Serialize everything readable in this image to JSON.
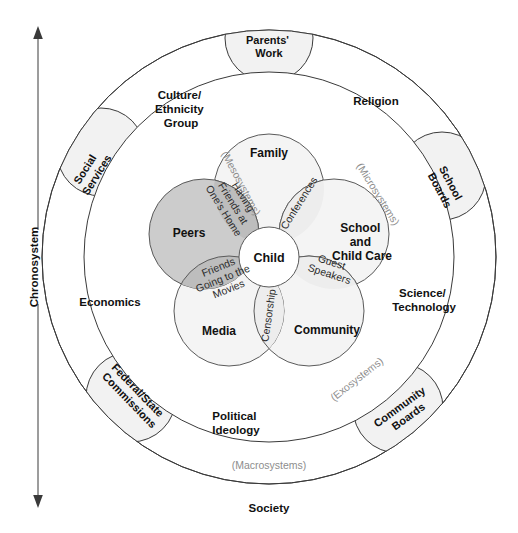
{
  "diagram": {
    "axis": {
      "label": "Chronosystem",
      "icon": "double-arrow-vertical-icon"
    },
    "system_labels": {
      "microsystems": "(Microsystems)",
      "mesosystems": "(Mesosystems)",
      "exosystems": "(Exosystems)",
      "macrosystems": "(Macrosystems)"
    },
    "society_label": "Society",
    "macro_ring_texts": [
      {
        "name": "culture-ethnicity-group",
        "lines": [
          "Culture/",
          "Ethnicity",
          "Group"
        ]
      },
      {
        "name": "religion",
        "lines": [
          "Religion"
        ]
      },
      {
        "name": "economics",
        "lines": [
          "Economics"
        ]
      },
      {
        "name": "science-technology",
        "lines": [
          "Science/",
          "Technology"
        ]
      },
      {
        "name": "political-ideology",
        "lines": [
          "Political",
          "Ideology"
        ]
      }
    ],
    "exo_lobes": [
      {
        "name": "parents-work",
        "lines": [
          "Parents'",
          "Work"
        ],
        "rotation": 0
      },
      {
        "name": "social-services",
        "lines": [
          "Social",
          "Services"
        ],
        "rotation": -58
      },
      {
        "name": "school-boards",
        "lines": [
          "School",
          "Boards"
        ],
        "rotation": 62
      },
      {
        "name": "federal-state-commissions",
        "lines": [
          "Federal/State",
          "Commissions"
        ],
        "rotation": 46
      },
      {
        "name": "community-boards",
        "lines": [
          "Community",
          "Boards"
        ],
        "rotation": -36
      }
    ],
    "micro_petals": [
      {
        "name": "family",
        "lines": [
          "Family"
        ],
        "shade": "light"
      },
      {
        "name": "peers",
        "lines": [
          "Peers"
        ],
        "shade": "dark"
      },
      {
        "name": "school-and-child-care",
        "lines": [
          "School",
          "and",
          "Child Care"
        ],
        "shade": "light"
      },
      {
        "name": "media",
        "lines": [
          "Media"
        ],
        "shade": "light"
      },
      {
        "name": "community",
        "lines": [
          "Community"
        ],
        "shade": "light"
      }
    ],
    "center": {
      "name": "child",
      "label": "Child"
    },
    "meso_lenses": [
      {
        "name": "having-friends-at-ones-home",
        "lines": [
          "Having",
          "Friends at",
          "One's Home"
        ],
        "shade": "dark",
        "rotation": 58
      },
      {
        "name": "conferences",
        "lines": [
          "Conferences"
        ],
        "shade": "light",
        "rotation": -58
      },
      {
        "name": "friends-going-to-the-movies",
        "lines": [
          "Friends",
          "Going to the",
          "Movies"
        ],
        "shade": "dark",
        "rotation": -22
      },
      {
        "name": "guest-speakers",
        "lines": [
          "Guest",
          "Speakers"
        ],
        "shade": "light",
        "rotation": 18
      },
      {
        "name": "censorship",
        "lines": [
          "Censorship"
        ],
        "shade": "light",
        "rotation": -82
      }
    ],
    "colors": {
      "outline": "#3a3a3a",
      "petal_light": "#f4f4f4",
      "petal_dark": "#cccccc",
      "lens_light": "#ededed",
      "lens_dark": "#bdbdbd",
      "system_text": "#8d8d8d",
      "background": "#ffffff"
    }
  }
}
